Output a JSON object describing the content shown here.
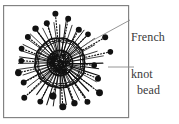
{
  "figure": {
    "kind": "embroidery-stitch-diagram",
    "title_text": "",
    "frame": {
      "name": "diagram-frame",
      "x": 3,
      "y": 5,
      "width": 126,
      "height": 113,
      "stroke_color": "#808080",
      "stroke_width": 1.2,
      "fill_color": "#ffffff"
    },
    "motif": {
      "name": "beaded-french-knot-rosette",
      "center_x": 60,
      "center_y": 63,
      "core_radius": 12,
      "ring_radius": 25,
      "spoke_outer_radius": 41,
      "ink_color": "#111111",
      "spoke_count": 40,
      "bead_count": 22,
      "bead_radius": 3.2,
      "bead_min_distance": 33,
      "bead_max_distance": 52
    },
    "labels": [
      {
        "id": "french-knot",
        "name": "label-french-knot",
        "line1": "French",
        "line2": "knot",
        "text": "French knot",
        "x": 131,
        "y": 7,
        "color": "#3a3a3a",
        "leader": {
          "name": "leader-line-french-knot",
          "x1": 130,
          "y1": 20,
          "x2": 86,
          "y2": 44,
          "color": "#8a8a8a"
        }
      },
      {
        "id": "bead",
        "name": "label-bead",
        "line1": "bead",
        "line2": "",
        "text": "bead",
        "x": 137,
        "y": 60,
        "color": "#3a3a3a",
        "leader": {
          "name": "leader-line-bead",
          "x1": 134,
          "y1": 67,
          "x2": 108,
          "y2": 67,
          "color": "#8a8a8a"
        }
      }
    ],
    "colors": {
      "background": "#ffffff",
      "frame_stroke": "#808080",
      "ink": "#111111",
      "leader": "#8a8a8a",
      "text": "#3a3a3a"
    }
  }
}
